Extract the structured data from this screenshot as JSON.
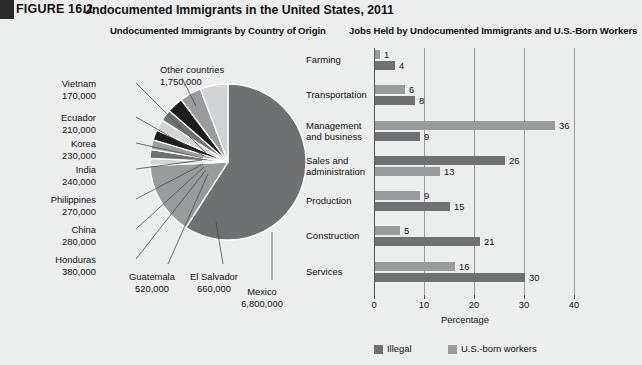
{
  "figure": {
    "number": "FIGURE 16.2",
    "title": "Undocumented Immigrants in the United States, 2011"
  },
  "pie_subtitle": "Undocumented Immigrants by Country of Origin",
  "bar_subtitle": "Jobs Held by Undocumented Immigrants and U.S.-Born Workers",
  "colors": {
    "background": "#eceded",
    "mexico": "#6f7072",
    "other": "#9a9b9d",
    "light": "#d2d3d4",
    "mid": "#9a9b9d",
    "dark": "#1c1c1c",
    "bar_illegal": "#6f7072",
    "bar_usborn": "#9a9b9d",
    "axis": "#555555",
    "grid": "#9a9a9a"
  },
  "chart_data": [
    {
      "type": "pie",
      "title": "Undocumented Immigrants by Country of Origin",
      "unit": "people",
      "labels": [
        "Mexico",
        "Other countries",
        "El Salvador",
        "Guatemala",
        "Honduras",
        "China",
        "Philippines",
        "India",
        "Korea",
        "Ecuador",
        "Vietnam"
      ],
      "values": [
        6800000,
        1750000,
        660000,
        520000,
        380000,
        280000,
        270000,
        240000,
        230000,
        210000,
        170000
      ],
      "value_text": [
        "6,800,000",
        "1,750,000",
        "660,000",
        "520,000",
        "380,000",
        "280,000",
        "270,000",
        "240,000",
        "230,000",
        "210,000",
        "170,000"
      ],
      "slice_colors": [
        "#6f7072",
        "#9a9b9d",
        "#d2d3d4",
        "#9a9b9d",
        "#1c1c1c",
        "#6f7072",
        "#d2d3d4",
        "#1c1c1c",
        "#9a9b9d",
        "#6f7072",
        "#d2d3d4"
      ],
      "legend": "none"
    },
    {
      "type": "bar",
      "orientation": "horizontal",
      "title": "Jobs Held by Undocumented Immigrants and U.S.-Born Workers",
      "xlabel": "Percentage",
      "ylabel": "",
      "xlim": [
        0,
        40
      ],
      "xticks": [
        "0",
        "10",
        "20",
        "30",
        "40"
      ],
      "grid": true,
      "legend_position": "bottom",
      "categories": [
        "Farming",
        "Transportation",
        "Management and business",
        "Sales and administration",
        "Production",
        "Construction",
        "Services"
      ],
      "series": [
        {
          "name": "Illegal",
          "color": "#6f7072",
          "values": [
            4,
            8,
            9,
            26,
            15,
            21,
            30
          ]
        },
        {
          "name": "U.S.-born workers",
          "color": "#9a9b9d",
          "values": [
            1,
            6,
            36,
            13,
            9,
            5,
            16
          ]
        }
      ],
      "row_order": [
        {
          "category": "Farming",
          "top": {
            "series": "U.S.-born workers",
            "value": 1
          },
          "bottom": {
            "series": "Illegal",
            "value": 4
          }
        },
        {
          "category": "Transportation",
          "top": {
            "series": "U.S.-born workers",
            "value": 6
          },
          "bottom": {
            "series": "Illegal",
            "value": 8
          }
        },
        {
          "category": "Management and business",
          "top": {
            "series": "U.S.-born workers",
            "value": 36
          },
          "bottom": {
            "series": "Illegal",
            "value": 9
          }
        },
        {
          "category": "Sales and administration",
          "top": {
            "series": "Illegal",
            "value": 26
          },
          "bottom": {
            "series": "U.S.-born workers",
            "value": 13
          }
        },
        {
          "category": "Production",
          "top": {
            "series": "U.S.-born workers",
            "value": 9
          },
          "bottom": {
            "series": "Illegal",
            "value": 15
          }
        },
        {
          "category": "Construction",
          "top": {
            "series": "U.S.-born workers",
            "value": 5
          },
          "bottom": {
            "series": "Illegal",
            "value": 21
          }
        },
        {
          "category": "Services",
          "top": {
            "series": "U.S.-born workers",
            "value": 16
          },
          "bottom": {
            "series": "Illegal",
            "value": 30
          }
        }
      ]
    }
  ],
  "bar_chart": {
    "xlabel": "Percentage",
    "xticks": [
      "0",
      "10",
      "20",
      "30",
      "40"
    ],
    "categories": [
      {
        "line1": "Farming",
        "line2": ""
      },
      {
        "line1": "Transportation",
        "line2": ""
      },
      {
        "line1": "Management",
        "line2": "and business"
      },
      {
        "line1": "Sales and",
        "line2": "administration"
      },
      {
        "line1": "Production",
        "line2": ""
      },
      {
        "line1": "Construction",
        "line2": ""
      },
      {
        "line1": "Services",
        "line2": ""
      }
    ],
    "rows": [
      {
        "top_value": "1",
        "top_series": "usborn",
        "bottom_value": "4",
        "bottom_series": "illegal"
      },
      {
        "top_value": "6",
        "top_series": "usborn",
        "bottom_value": "8",
        "bottom_series": "illegal"
      },
      {
        "top_value": "36",
        "top_series": "usborn",
        "bottom_value": "9",
        "bottom_series": "illegal"
      },
      {
        "top_value": "26",
        "top_series": "illegal",
        "bottom_value": "13",
        "bottom_series": "usborn"
      },
      {
        "top_value": "9",
        "top_series": "usborn",
        "bottom_value": "15",
        "bottom_series": "illegal"
      },
      {
        "top_value": "5",
        "top_series": "usborn",
        "bottom_value": "21",
        "bottom_series": "illegal"
      },
      {
        "top_value": "16",
        "top_series": "usborn",
        "bottom_value": "30",
        "bottom_series": "illegal"
      }
    ],
    "legend": [
      {
        "label": "Illegal",
        "color": "#6f7072"
      },
      {
        "label": "U.S.-born workers",
        "color": "#9a9b9d"
      }
    ]
  },
  "pie_chart": {
    "slices": [
      {
        "name": "Mexico",
        "value": "6,800,000",
        "num": 6800000,
        "color": "#6f7072"
      },
      {
        "name": "Other countries",
        "value": "1,750,000",
        "num": 1750000,
        "color": "#9a9b9d"
      },
      {
        "name": "Vietnam",
        "value": "170,000",
        "num": 170000,
        "color": "#d2d3d4"
      },
      {
        "name": "Ecuador",
        "value": "210,000",
        "num": 210000,
        "color": "#6f7072"
      },
      {
        "name": "Korea",
        "value": "230,000",
        "num": 230000,
        "color": "#9a9b9d"
      },
      {
        "name": "India",
        "value": "240,000",
        "num": 240000,
        "color": "#1c1c1c"
      },
      {
        "name": "Philippines",
        "value": "270,000",
        "num": 270000,
        "color": "#d2d3d4"
      },
      {
        "name": "China",
        "value": "280,000",
        "num": 280000,
        "color": "#6f7072"
      },
      {
        "name": "Honduras",
        "value": "380,000",
        "num": 380000,
        "color": "#1c1c1c"
      },
      {
        "name": "Guatemala",
        "value": "520,000",
        "num": 520000,
        "color": "#9a9b9d"
      },
      {
        "name": "El Salvador",
        "value": "660,000",
        "num": 660000,
        "color": "#d2d3d4"
      }
    ]
  }
}
